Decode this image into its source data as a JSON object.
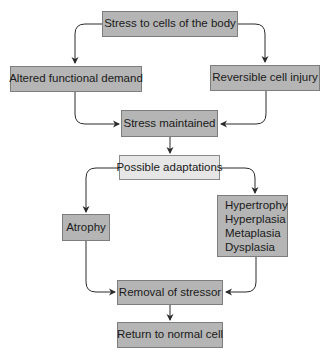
{
  "diagram": {
    "type": "flowchart",
    "colors": {
      "box_fill": "#b5b5b5",
      "box_border": "#7d7d7d",
      "highlight_box_fill": "#e6e6e6",
      "line": "#2a2a2a",
      "text": "#1a1a1a"
    },
    "nodes": {
      "stress_to_cells": {
        "label": "Stress to cells of the body"
      },
      "altered_demand": {
        "label": "Altered functional demand"
      },
      "reversible_injury": {
        "label": "Reversible cell injury"
      },
      "stress_maintained": {
        "label": "Stress maintained"
      },
      "possible_adaptations": {
        "label": "Possible adaptations"
      },
      "atrophy": {
        "label": "Atrophy"
      },
      "adaptations_list": {
        "lines": [
          "Hypertrophy",
          "Hyperplasia",
          "Metaplasia",
          "Dysplasia"
        ]
      },
      "removal_of_stressor": {
        "label": "Removal of stressor"
      },
      "return_to_normal": {
        "label": "Return to normal cell"
      }
    },
    "edges": [
      {
        "from": "Stress to cells of the body",
        "to": "Altered functional demand"
      },
      {
        "from": "Stress to cells of the body",
        "to": "Reversible cell injury"
      },
      {
        "from": "Altered functional demand",
        "to": "Stress maintained"
      },
      {
        "from": "Reversible cell injury",
        "to": "Stress maintained"
      },
      {
        "from": "Stress maintained",
        "to": "Possible adaptations"
      },
      {
        "from": "Possible adaptations",
        "to": "Atrophy"
      },
      {
        "from": "Possible adaptations",
        "to": "Hypertrophy / Hyperplasia / Metaplasia / Dysplasia"
      },
      {
        "from": "Atrophy",
        "to": "Removal of stressor"
      },
      {
        "from": "Hypertrophy / Hyperplasia / Metaplasia / Dysplasia",
        "to": "Removal of stressor"
      },
      {
        "from": "Removal of stressor",
        "to": "Return to normal cell"
      }
    ]
  }
}
